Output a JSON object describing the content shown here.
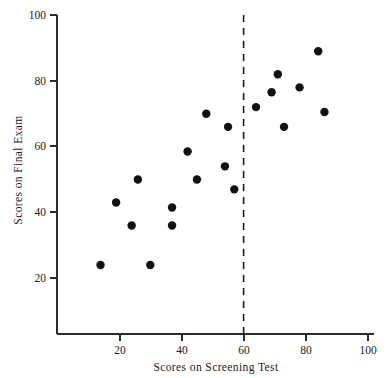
{
  "chart_data": {
    "type": "scatter",
    "title": "",
    "xlabel": "Scores on Screening Test",
    "ylabel": "Scores on Final Exam",
    "xlim": [
      0,
      100
    ],
    "ylim": [
      0,
      100
    ],
    "grid": false,
    "legend": null,
    "xticks": [
      20,
      40,
      60,
      80,
      100
    ],
    "yticks": [
      20,
      40,
      60,
      80,
      100
    ],
    "xtick_labels": [
      "20",
      "40",
      "60",
      "80",
      "100"
    ],
    "ytick_labels": [
      "20",
      "40",
      "60",
      "80",
      "100"
    ],
    "marker": "filled-circle",
    "marker_color": "#111111",
    "marker_size_px": 4.2,
    "points": [
      {
        "x": 14,
        "y": 24
      },
      {
        "x": 19,
        "y": 43
      },
      {
        "x": 24,
        "y": 36
      },
      {
        "x": 26,
        "y": 50
      },
      {
        "x": 30,
        "y": 24
      },
      {
        "x": 37,
        "y": 41.5
      },
      {
        "x": 37,
        "y": 36
      },
      {
        "x": 42,
        "y": 58.5
      },
      {
        "x": 45,
        "y": 50
      },
      {
        "x": 48,
        "y": 70
      },
      {
        "x": 54,
        "y": 54
      },
      {
        "x": 55,
        "y": 66
      },
      {
        "x": 57,
        "y": 47
      },
      {
        "x": 64,
        "y": 72
      },
      {
        "x": 69,
        "y": 76.5
      },
      {
        "x": 71,
        "y": 82
      },
      {
        "x": 73,
        "y": 66
      },
      {
        "x": 78,
        "y": 78
      },
      {
        "x": 84,
        "y": 89
      },
      {
        "x": 86,
        "y": 70.5
      }
    ],
    "annotations": [
      {
        "name": "cutoff-threshold",
        "type": "vertical-dashed-line",
        "x": 60,
        "label": "",
        "color": "#1a1a1a"
      }
    ]
  },
  "axes": {
    "x_title": "Scores on Screening Test",
    "y_title": "Scores on Final Exam",
    "x_tick_labels": [
      "20",
      "40",
      "60",
      "80",
      "100"
    ],
    "y_tick_labels": [
      "20",
      "40",
      "60",
      "80",
      "100"
    ]
  },
  "colors": {
    "axis": "#2b2b2b",
    "marker": "#111111",
    "threshold": "#1a1a1a",
    "background": "#ffffff"
  }
}
